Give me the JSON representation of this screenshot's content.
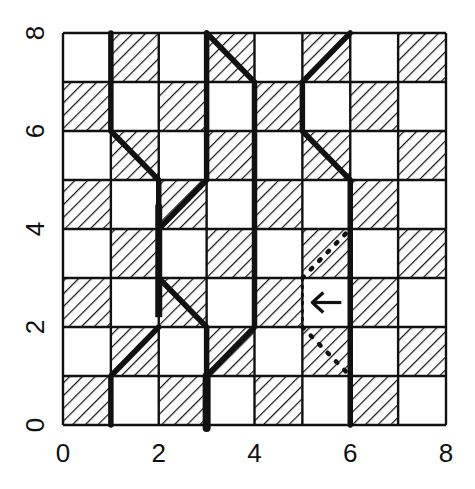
{
  "figure": {
    "type": "checkerboard-path-diagram",
    "grid": {
      "cols": 8,
      "rows": 8,
      "hatched_parity": "even",
      "hatched_first_cell": [
        0,
        0
      ]
    },
    "x_axis": {
      "ticks": [
        "0",
        "2",
        "4",
        "6",
        "8"
      ]
    },
    "y_axis": {
      "ticks": [
        "0",
        "2",
        "4",
        "6",
        "8"
      ],
      "label_rotation": "vertical"
    },
    "colors": {
      "line": "#111111",
      "background": "#ffffff",
      "hatch": "#111111"
    },
    "thick_paths": [
      {
        "name": "path-a",
        "points": [
          [
            1,
            8
          ],
          [
            1,
            6
          ],
          [
            2,
            5
          ],
          [
            2,
            3
          ],
          [
            3,
            2
          ],
          [
            3,
            0
          ]
        ]
      },
      {
        "name": "path-b",
        "points": [
          [
            3,
            8
          ],
          [
            3,
            5
          ],
          [
            2,
            4
          ]
        ]
      },
      {
        "name": "path-b-lower",
        "points": [
          [
            2,
            2
          ],
          [
            1,
            1
          ],
          [
            1,
            0
          ]
        ]
      },
      {
        "name": "path-c",
        "points": [
          [
            3,
            8
          ],
          [
            4,
            7
          ],
          [
            4,
            2
          ],
          [
            3,
            1
          ],
          [
            3,
            0
          ]
        ]
      },
      {
        "name": "path-d",
        "points": [
          [
            6,
            8
          ],
          [
            5,
            7
          ],
          [
            5,
            6
          ],
          [
            6,
            5
          ],
          [
            6,
            0
          ]
        ]
      }
    ],
    "dotted_paths": [
      {
        "name": "dotted-upper",
        "points": [
          [
            5,
            3
          ],
          [
            6,
            4
          ]
        ]
      },
      {
        "name": "dotted-lower",
        "points": [
          [
            5,
            2
          ],
          [
            6,
            1
          ]
        ]
      },
      {
        "name": "dotted-vertical",
        "points": [
          [
            5,
            3
          ],
          [
            5,
            2
          ]
        ]
      }
    ],
    "arrow": {
      "symbol": "←",
      "cell": [
        5,
        2
      ],
      "direction": "left"
    }
  }
}
